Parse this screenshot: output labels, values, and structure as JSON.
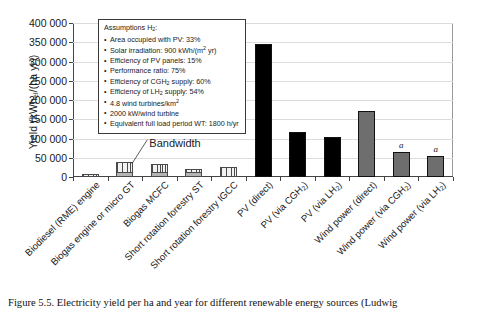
{
  "figure": {
    "caption": "Figure 5.5. Electricity yield per ha and year for different renewable energy sources (Ludwig"
  },
  "assumptions": {
    "heading_text": "Assumptions H",
    "heading_sub": "2",
    "heading_tail": ":",
    "items": [
      {
        "text": "Area occupied with PV: 33%"
      },
      {
        "pre": "Solar irradiation: 900 kWh/(m",
        "sup": "2",
        "post": " yr)"
      },
      {
        "text": "Efficiency of PV panels: 15%"
      },
      {
        "text": "Performance ratio: 75%"
      },
      {
        "pre": "Efficiency of CGH",
        "sub": "2",
        "post": " supply: 60%"
      },
      {
        "pre": "Efficiency of LH",
        "sub": "2",
        "post": " supply: 54%"
      },
      {
        "pre": "4.8 wind turbines/km",
        "sup": "2",
        "post": ""
      },
      {
        "text": "2000 kW/wind turbine"
      },
      {
        "text": "Equivalent full load period WT: 1800 h/yr"
      }
    ]
  },
  "annotations": {
    "bandwidth_label": "Bandwidth",
    "footnote_marker": "a"
  },
  "chart_data": {
    "type": "bar",
    "title": "",
    "xlabel": "",
    "ylabel": "Yield (kWhel/(ha yr))",
    "ylabel_pre": "Yield (kWh",
    "ylabel_sub": "el",
    "ylabel_post": "/(ha yr))",
    "ylim": [
      0,
      400000
    ],
    "ytick_step": 50000,
    "ytick_labels": [
      "0",
      "50 000",
      "100 000",
      "150 000",
      "200 000",
      "250 000",
      "300 000",
      "350 000",
      "400 000"
    ],
    "ytick_values": [
      0,
      50000,
      100000,
      150000,
      200000,
      250000,
      300000,
      350000,
      400000
    ],
    "grid": true,
    "legend": "none",
    "categories": [
      "Biodiesel (RME) engine",
      "Biogas engine or micro GT",
      "Biogas MCFC",
      "Short rotation forestry ST",
      "Short rotation forestry IGCC",
      "PV (direct)",
      "PV (via CGH2)",
      "PV (via LH2)",
      "Wind power (direct)",
      "Wind power (via CGH2)",
      "Wind power (via LH2)"
    ],
    "category_labels": [
      {
        "pre": "Biodiesel (RME) engine",
        "sub": "",
        "post": ""
      },
      {
        "pre": "Biogas engine or micro GT",
        "sub": "",
        "post": ""
      },
      {
        "pre": "Biogas MCFC",
        "sub": "",
        "post": ""
      },
      {
        "pre": "Short rotation forestry ST",
        "sub": "",
        "post": ""
      },
      {
        "pre": "Short rotation forestry IGCC",
        "sub": "",
        "post": ""
      },
      {
        "pre": "PV (direct)",
        "sub": "",
        "post": ""
      },
      {
        "pre": "PV (via CGH",
        "sub": "2",
        "post": ")"
      },
      {
        "pre": "PV (via LH",
        "sub": "2",
        "post": ")"
      },
      {
        "pre": "Wind power (direct)",
        "sub": "",
        "post": ""
      },
      {
        "pre": "Wind power (via CGH",
        "sub": "2",
        "post": ")"
      },
      {
        "pre": "Wind power (via LH",
        "sub": "2",
        "post": ")"
      }
    ],
    "values": [
      7000,
      40000,
      35000,
      20000,
      25000,
      345000,
      118000,
      103000,
      172000,
      65000,
      55000
    ],
    "bar_detail": [
      {
        "name": "Biodiesel (RME) engine",
        "base": 7000,
        "top": 7000,
        "style": "hatched"
      },
      {
        "name": "Biogas engine or micro GT",
        "base": 13000,
        "top": 40000,
        "style": "hatched"
      },
      {
        "name": "Biogas MCFC",
        "base": 13000,
        "top": 35000,
        "style": "hatched"
      },
      {
        "name": "Short rotation forestry ST",
        "base": 12000,
        "top": 20000,
        "style": "hatched"
      },
      {
        "name": "Short rotation forestry IGCC",
        "base": 25000,
        "top": 25000,
        "style": "hatched"
      },
      {
        "name": "PV (direct)",
        "base": 345000,
        "top": 345000,
        "style": "solid-black"
      },
      {
        "name": "PV (via CGH2)",
        "base": 118000,
        "top": 118000,
        "style": "solid-black"
      },
      {
        "name": "PV (via LH2)",
        "base": 103000,
        "top": 103000,
        "style": "solid-black"
      },
      {
        "name": "Wind power (direct)",
        "base": 172000,
        "top": 172000,
        "style": "solid-gray"
      },
      {
        "name": "Wind power (via CGH2)",
        "base": 65000,
        "top": 65000,
        "style": "solid-gray"
      },
      {
        "name": "Wind power (via LH2)",
        "base": 55000,
        "top": 55000,
        "style": "solid-gray"
      }
    ],
    "footnote_bars": [
      "Wind power (via CGH2)",
      "Wind power (via LH2)"
    ],
    "colors": {
      "hatched_fill": "#f2f2f2",
      "hatched_stroke": "#4a4a4a",
      "base_fill": "#b4b4b4",
      "solid_black": "#000000",
      "solid_gray": "#6e6e6e",
      "grid": "#dcdcdc",
      "axis": "#444444"
    }
  }
}
